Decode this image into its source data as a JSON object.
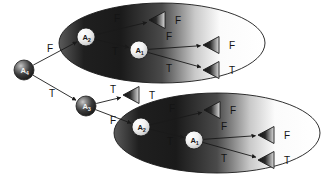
{
  "figure": {
    "type": "decision-diagram",
    "title": "",
    "background": "#ffffff",
    "width": 327,
    "height": 183,
    "stroke_color": "#1a1a1a",
    "label_color": "#141414"
  },
  "nodes": [
    {
      "id": "A4",
      "name": "A",
      "sub": "4",
      "x": 24,
      "y": 70,
      "r": 10,
      "style": "dark-sphere",
      "group": "root"
    },
    {
      "id": "A3",
      "name": "A",
      "sub": "3",
      "x": 86,
      "y": 106,
      "r": 10,
      "style": "dark-sphere",
      "group": "mid"
    },
    {
      "id": "T2A2",
      "name": "A",
      "sub": "2",
      "x": 86,
      "y": 37,
      "r": 9,
      "style": "light-sphere",
      "group": "top-ellipse"
    },
    {
      "id": "T2A1",
      "name": "A",
      "sub": "1",
      "x": 139,
      "y": 50,
      "r": 9,
      "style": "light-sphere",
      "group": "top-ellipse"
    },
    {
      "id": "B2A2",
      "name": "A",
      "sub": "2",
      "x": 141,
      "y": 127,
      "r": 9,
      "style": "light-sphere",
      "group": "bottom-ellipse"
    },
    {
      "id": "B2A1",
      "name": "A",
      "sub": "1",
      "x": 194,
      "y": 140,
      "r": 9,
      "style": "light-sphere",
      "group": "bottom-ellipse"
    }
  ],
  "leaves": [
    {
      "id": "L1",
      "label": "F",
      "x": 157,
      "y": 20,
      "group": "top-ellipse"
    },
    {
      "id": "L2",
      "label": "F",
      "x": 211,
      "y": 45,
      "group": "top-ellipse"
    },
    {
      "id": "L3",
      "label": "T",
      "x": 211,
      "y": 70,
      "group": "top-ellipse"
    },
    {
      "id": "L4",
      "label": "T",
      "x": 131,
      "y": 95,
      "group": "mid"
    },
    {
      "id": "L5",
      "label": "F",
      "x": 212,
      "y": 110,
      "group": "bottom-ellipse"
    },
    {
      "id": "L6",
      "label": "F",
      "x": 266,
      "y": 135,
      "group": "bottom-ellipse"
    },
    {
      "id": "L7",
      "label": "T",
      "x": 266,
      "y": 160,
      "group": "bottom-ellipse"
    }
  ],
  "edges": [
    {
      "from": "A4",
      "to": "T2A2",
      "label": "F",
      "label_x": 47,
      "label_y": 52
    },
    {
      "from": "A4",
      "to": "A3",
      "label": "T",
      "label_x": 49,
      "label_y": 97
    },
    {
      "from": "T2A2",
      "to": "L1",
      "label": "F",
      "label_x": 114,
      "label_y": 22
    },
    {
      "from": "T2A2",
      "to": "T2A1",
      "label": "T",
      "label_x": 112,
      "label_y": 55
    },
    {
      "from": "T2A1",
      "to": "L2",
      "label": "F",
      "label_x": 166,
      "label_y": 40
    },
    {
      "from": "T2A1",
      "to": "L3",
      "label": "T",
      "label_x": 166,
      "label_y": 72
    },
    {
      "from": "A3",
      "to": "L4",
      "label": "T",
      "label_x": 110,
      "label_y": 93
    },
    {
      "from": "A3",
      "to": "B2A2",
      "label": "F",
      "label_x": 110,
      "label_y": 124
    },
    {
      "from": "B2A2",
      "to": "L5",
      "label": "F",
      "label_x": 169,
      "label_y": 112
    },
    {
      "from": "B2A2",
      "to": "B2A1",
      "label": "T",
      "label_x": 167,
      "label_y": 145
    },
    {
      "from": "B2A1",
      "to": "L6",
      "label": "F",
      "label_x": 221,
      "label_y": 130
    },
    {
      "from": "B2A1",
      "to": "L7",
      "label": "T",
      "label_x": 221,
      "label_y": 162
    }
  ],
  "leaf_labels": [
    {
      "for": "L1",
      "text": "F",
      "x": 175,
      "y": 20
    },
    {
      "for": "L2",
      "text": "F",
      "x": 229,
      "y": 45
    },
    {
      "for": "L3",
      "text": "T",
      "x": 229,
      "y": 70
    },
    {
      "for": "L4",
      "text": "T",
      "x": 149,
      "y": 95
    },
    {
      "for": "L5",
      "text": "F",
      "x": 230,
      "y": 110
    },
    {
      "for": "L6",
      "text": "F",
      "x": 284,
      "y": 135
    },
    {
      "for": "L7",
      "text": "T",
      "x": 284,
      "y": 160
    }
  ],
  "ellipses": [
    {
      "id": "top-ellipse",
      "cx": 162,
      "cy": 43,
      "rx": 103,
      "ry": 40
    },
    {
      "id": "bottom-ellipse",
      "cx": 217,
      "cy": 133,
      "rx": 103,
      "ry": 40
    }
  ]
}
